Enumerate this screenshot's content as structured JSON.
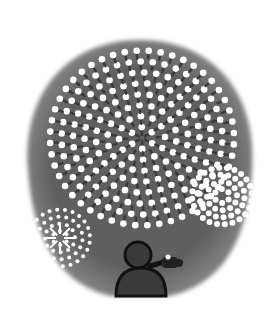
{
  "illustration": {
    "subject": "person photographing fireworks at night",
    "colors": {
      "background": "#ffffff",
      "sky": "#5e5e5e",
      "sky_edge": "#8a8a8a",
      "spark": "#ffffff",
      "trail": "#3a3a3a",
      "person": "#2a2a2a",
      "person_outline": "#111111"
    },
    "elements": [
      "large-firework-burst",
      "small-firework-left",
      "small-firework-right",
      "person-silhouette",
      "camera-icon"
    ]
  }
}
